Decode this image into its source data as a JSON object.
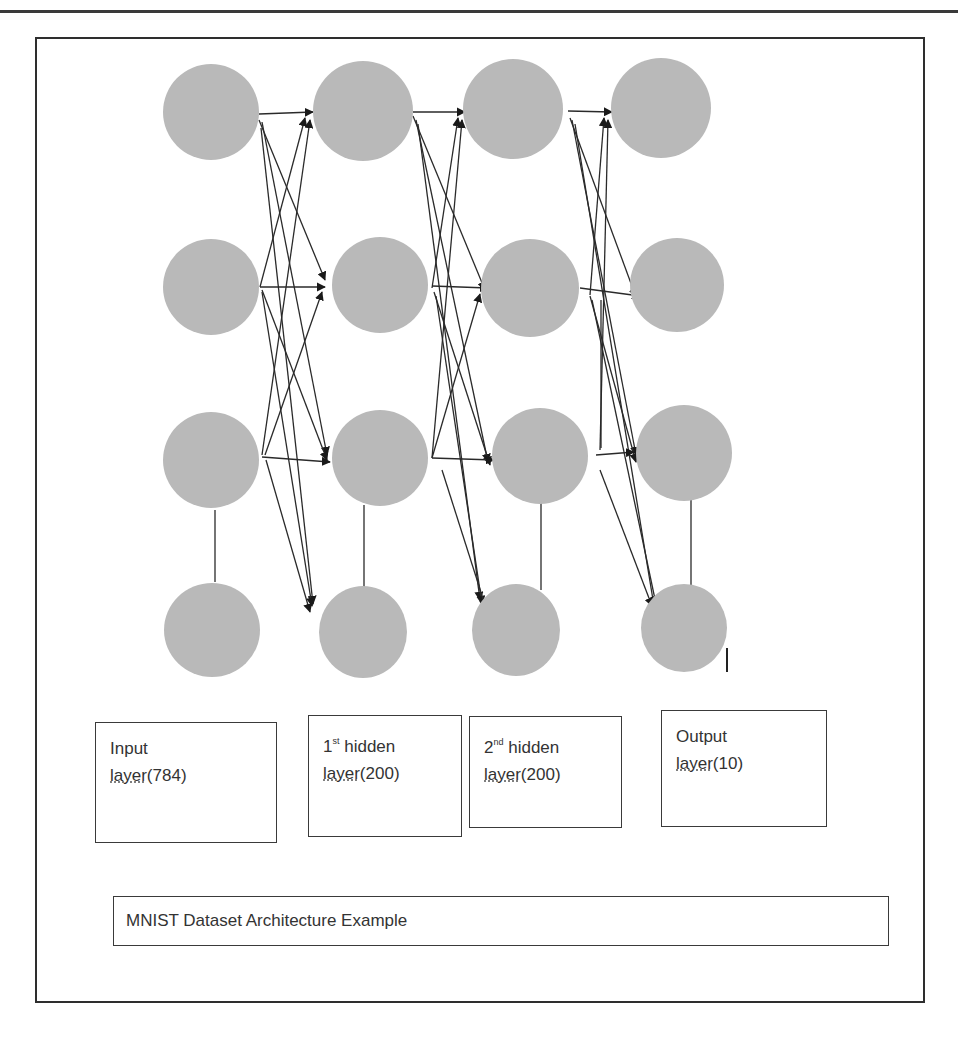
{
  "figure": {
    "title": "MNIST Dataset Architecture Example",
    "node_color": "#b9b9b9",
    "edge_color": "#2a2a2a",
    "layers": [
      {
        "name": "Input",
        "line1": "Input",
        "line2_underlined": "layer",
        "line2_rest": "(784)",
        "size": 784
      },
      {
        "name": "1st hidden",
        "ordinal": "1",
        "ordinal_suffix": "st",
        "line1_rest": " hidden",
        "line2_underlined": "layer",
        "line2_rest": "(200)",
        "size": 200
      },
      {
        "name": "2nd hidden",
        "ordinal": "2",
        "ordinal_suffix": "nd",
        "line1_rest": " hidden",
        "line2_underlined": "layer",
        "line2_rest": "(200)",
        "size": 200
      },
      {
        "name": "Output",
        "line1": "Output",
        "line2_underlined": "layer",
        "line2_rest": "(10)",
        "size": 10
      }
    ],
    "nodes_drawn_per_layer": 4
  }
}
